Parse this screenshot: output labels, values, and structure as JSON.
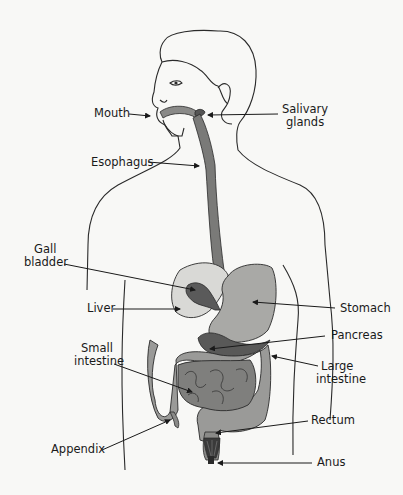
{
  "diagram": {
    "colors": {
      "background": "#f8f8f6",
      "outline": "#2a2a2a",
      "liver": "#d9d9d6",
      "gallbladder": "#5a5a5a",
      "stomach": "#a9a9a6",
      "esophagus": "#7a7a78",
      "pancreas": "#595958",
      "large_intestine": "#9a9a98",
      "small_intestine": "#7f7f7d",
      "rectum": "#8a8a88",
      "anus": "#3a3a3a"
    },
    "labels": {
      "mouth": "Mouth",
      "salivary_line1": "Salivary",
      "salivary_line2": "glands",
      "esophagus": "Esophagus",
      "gall_line1": "Gall",
      "gall_line2": "bladder",
      "liver": "Liver",
      "stomach": "Stomach",
      "pancreas": "Pancreas",
      "small_line1": "Small",
      "small_line2": "intestine",
      "large_line1": "Large",
      "large_line2": "intestine",
      "rectum": "Rectum",
      "appendix": "Appendix",
      "anus": "Anus"
    }
  }
}
